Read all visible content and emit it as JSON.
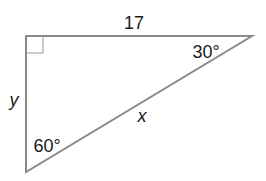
{
  "figure": {
    "type": "right-triangle",
    "line_color": "#8a8a8a",
    "text_color": "#1a1a1a",
    "vertices": {
      "right_angle": [
        26,
        36
      ],
      "top_right": [
        252,
        36
      ],
      "bottom_left": [
        26,
        172
      ]
    },
    "labels": {
      "top_side": "17",
      "left_side": "y",
      "hypotenuse": "x",
      "angle_top_right": "30°",
      "angle_bottom_left": "60°"
    },
    "right_angle_marker": true
  }
}
